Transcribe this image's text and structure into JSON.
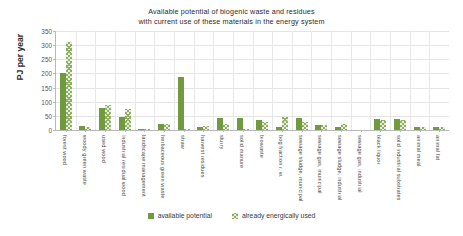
{
  "chart_data": {
    "type": "bar",
    "title": "Available potential of biogenic waste and residues with current use of these materials in the energy system",
    "title_lines": [
      "Available potential of biogenic waste and residues",
      "with current use of these materials in the energy system"
    ],
    "xlabel": "",
    "ylabel": "PJ per year",
    "ylim": [
      0,
      350
    ],
    "yticks": [
      0,
      50,
      100,
      150,
      200,
      250,
      300,
      350
    ],
    "grid": true,
    "legend_position": "bottom",
    "colors": {
      "available_potential": "#6f9a3e",
      "already_energically_used": "#8fae62",
      "grid": "#e4e4e4",
      "axis": "#b9b9b9",
      "text": "#3a3a3a"
    },
    "categories": [
      "forest wood",
      "woody green waste",
      "used wood",
      "industrial residual wood",
      "landscape management",
      "herbaceous green waste",
      "straw",
      "harvest residues",
      "slurry",
      "solid manure",
      "biowaste",
      "bog fraction r. w.",
      "sewage sludge, municipal",
      "sewage gas, municipal",
      "sewage sludge, industrial",
      "sewage gas, industrial",
      "black liquor",
      "solid industrial substrates",
      "animal meal",
      "animal fat"
    ],
    "series": [
      {
        "name": "available potential",
        "values": [
          200,
          13,
          78,
          47,
          3,
          20,
          189,
          11,
          44,
          44,
          35,
          9,
          41,
          19,
          12,
          0,
          38,
          38,
          12,
          9
        ]
      },
      {
        "name": "already energically used",
        "values": [
          311,
          10,
          87,
          74,
          4,
          22,
          4,
          15,
          21,
          3,
          28,
          45,
          27,
          17,
          23,
          0,
          36,
          35,
          11,
          9
        ]
      }
    ]
  },
  "legend": {
    "items": [
      {
        "label": "available potential",
        "style": "solid"
      },
      {
        "label": "already energically used",
        "style": "hatch"
      }
    ]
  }
}
